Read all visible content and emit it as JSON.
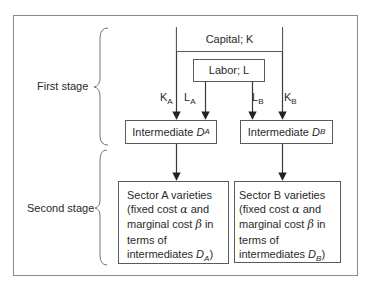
{
  "diagram": {
    "type": "flowchart",
    "stages": [
      {
        "label": "First stage"
      },
      {
        "label": "Second stage"
      }
    ],
    "nodes": {
      "capital": {
        "label": "Capital; K"
      },
      "labor": {
        "label": "Labor; L"
      },
      "intermediate_a": {
        "label": "Intermediate ",
        "var": "D",
        "sub": "A"
      },
      "intermediate_b": {
        "label": "Intermediate ",
        "var": "D",
        "sub": "B"
      },
      "sector_a": {
        "line1": "Sector A varieties",
        "line2_pre": "(fixed cost ",
        "alpha": "α",
        "line2_post": " and",
        "line3_pre": "marginal cost ",
        "beta": "β",
        "line3_post": " in",
        "line4": "terms of",
        "line5_pre": "intermediates ",
        "var": "D",
        "sub": "A",
        "close": ")"
      },
      "sector_b": {
        "line1": "Sector B varieties",
        "line2_pre": "(fixed cost ",
        "alpha": "α",
        "line2_post": " and",
        "line3_pre": "marginal cost ",
        "beta": "β",
        "line3_post": " in",
        "line4": "terms of",
        "line5_pre": "intermediates ",
        "var": "D",
        "sub": "B",
        "close": ")"
      }
    },
    "edge_labels": {
      "k_a": {
        "main": "K",
        "sub": "A"
      },
      "l_a": {
        "main": "L",
        "sub": "A"
      },
      "l_b": {
        "main": "L",
        "sub": "B"
      },
      "k_b": {
        "main": "K",
        "sub": "B"
      }
    },
    "edges": [
      {
        "from": "capital",
        "to": "intermediate_a",
        "label": "K_A"
      },
      {
        "from": "labor",
        "to": "intermediate_a",
        "label": "L_A"
      },
      {
        "from": "labor",
        "to": "intermediate_b",
        "label": "L_B"
      },
      {
        "from": "capital",
        "to": "intermediate_b",
        "label": "K_B"
      },
      {
        "from": "intermediate_a",
        "to": "sector_a"
      },
      {
        "from": "intermediate_b",
        "to": "sector_b"
      }
    ],
    "colors": {
      "line": "#3a3a3a",
      "frame": "#8a8a8a",
      "text": "#2a2a2a"
    }
  }
}
